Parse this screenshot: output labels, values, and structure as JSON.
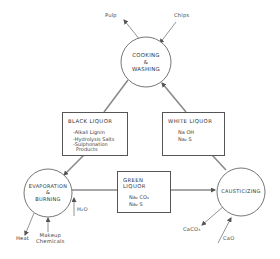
{
  "diagram": {
    "type": "process-cycle",
    "nodes": {
      "cooking": {
        "label_line1": "COOKING",
        "label_line2": "&",
        "label_line3": "WASHING"
      },
      "evaporation": {
        "label_line1": "EVAPORATION",
        "label_line2": "&",
        "label_line3": "BURNING"
      },
      "causticizing": {
        "label": "CAUSTICIZING"
      }
    },
    "boxes": {
      "black_liquor": {
        "title": "BLACK LIQUOR",
        "items": [
          "-Alkali Lignin",
          "-Hydrolysis Salts",
          "-Sulphonation",
          "Products"
        ]
      },
      "white_liquor": {
        "title": "WHITE LIQUOR",
        "items": [
          "Na OH",
          "Na₂ S"
        ]
      },
      "green_liquor": {
        "title": "GREEN LIQUOR",
        "items": [
          "Na₂ CO₃",
          "Na₂ S"
        ]
      }
    },
    "external_flows": {
      "pulp": "Pulp",
      "chips": "Chips",
      "heat": "Heat",
      "makeup_line1": "Makeup",
      "makeup_line2": "Chemicals",
      "water": "H₂O",
      "caco3": "CaCO₃",
      "cao": "CaO"
    },
    "colors": {
      "line": "#8a8a8a",
      "outline": "#555555",
      "text": "#333333"
    }
  }
}
